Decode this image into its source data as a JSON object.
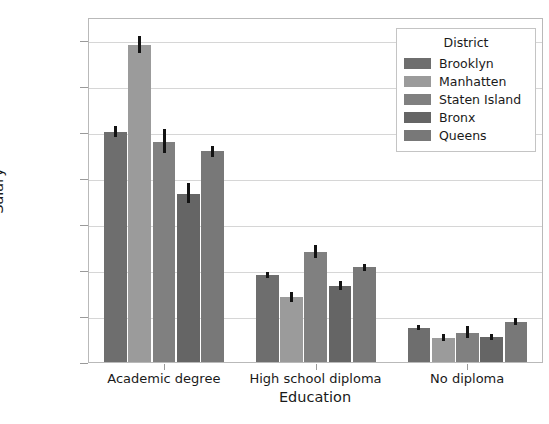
{
  "chart_data": {
    "type": "bar",
    "title": "",
    "xlabel": "Education",
    "ylabel": "Salary",
    "categories": [
      "Academic degree",
      "High school diploma",
      "No diploma"
    ],
    "ylim": [
      0,
      75000
    ],
    "yticks": [
      0,
      10000,
      20000,
      30000,
      40000,
      50000,
      60000,
      70000
    ],
    "ytick_labels": [
      "0",
      "10000",
      "20000",
      "30000",
      "40000",
      "50000",
      "60000",
      "70000"
    ],
    "grid": true,
    "legend": {
      "title": "District",
      "position": "upper right",
      "entries": [
        "Brooklyn",
        "Manhatten",
        "Staten Island",
        "Bronx",
        "Queens"
      ]
    },
    "series": [
      {
        "name": "Brooklyn",
        "color": "#6e6e6e",
        "values": [
          50400,
          19300,
          7900
        ],
        "err_low": [
          49300,
          18700,
          7300
        ],
        "err_high": [
          51800,
          19900,
          8500
        ]
      },
      {
        "name": "Manhatten",
        "color": "#9b9b9b",
        "values": [
          69400,
          14500,
          5700
        ],
        "err_low": [
          67600,
          13500,
          5000
        ],
        "err_high": [
          71400,
          15700,
          6600
        ]
      },
      {
        "name": "Staten Island",
        "color": "#808080",
        "values": [
          48300,
          24300,
          6800
        ],
        "err_low": [
          45800,
          23000,
          5600
        ],
        "err_high": [
          51100,
          25800,
          8300
        ]
      },
      {
        "name": "Bronx",
        "color": "#656565",
        "values": [
          37000,
          17000,
          5900
        ],
        "err_low": [
          34900,
          16100,
          5300
        ],
        "err_high": [
          39300,
          18000,
          6600
        ]
      },
      {
        "name": "Queens",
        "color": "#787878",
        "values": [
          46200,
          21000,
          9200
        ],
        "err_low": [
          45100,
          20300,
          8500
        ],
        "err_high": [
          47400,
          21800,
          9900
        ]
      }
    ]
  }
}
